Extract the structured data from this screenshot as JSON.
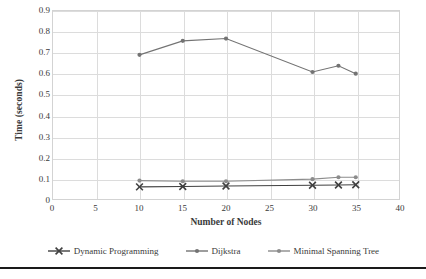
{
  "chart_data": {
    "type": "line",
    "title": "",
    "xlabel": "Number of Nodes",
    "ylabel": "Time (seconds)",
    "xlim": [
      0,
      40
    ],
    "ylim": [
      0,
      0.9
    ],
    "xticks": [
      0,
      5,
      10,
      15,
      20,
      25,
      30,
      35,
      40
    ],
    "xtick_labels": [
      "0",
      "5",
      "10",
      "15",
      "20",
      "25",
      "30",
      "35",
      "40"
    ],
    "yticks": [
      0,
      0.1,
      0.2,
      0.3,
      0.4,
      0.5,
      0.6,
      0.7,
      0.8,
      0.9
    ],
    "ytick_labels": [
      "0",
      "0.1",
      "0.2",
      "0.3",
      "0.4",
      "0.5",
      "0.6",
      "0.7",
      "0.8",
      "0.9"
    ],
    "grid": true,
    "grid_axis": "both",
    "legend_position": "bottom",
    "x": [
      10,
      15,
      20,
      30,
      33,
      35
    ],
    "series": [
      {
        "name": "Dynamic Programming",
        "marker": "x",
        "color": "#404040",
        "values": [
          0.058,
          0.06,
          0.062,
          0.066,
          0.067,
          0.068
        ]
      },
      {
        "name": "Dijkstra",
        "marker": "circle",
        "color": "#737373",
        "values": [
          0.69,
          0.757,
          0.768,
          0.608,
          0.638,
          0.6
        ]
      },
      {
        "name": "Minimal Spanning Tree",
        "marker": "circle",
        "color": "#8c8c8c",
        "values": [
          0.088,
          0.085,
          0.085,
          0.095,
          0.104,
          0.104
        ]
      }
    ]
  },
  "axes": {
    "y_title": "Time (seconds)",
    "x_title": "Number of Nodes"
  },
  "colors": {
    "grid": "#dcdcdc",
    "border": "#d3d3d3",
    "text": "#3a3a3a",
    "rule": "#1a1a1a"
  }
}
